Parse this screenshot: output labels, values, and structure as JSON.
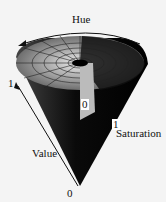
{
  "diagram": {
    "labels": {
      "hue": "Hue",
      "value": "Value",
      "saturation": "Saturation",
      "value_max": "1",
      "value_min": "0",
      "saturation_min": "0",
      "saturation_max": "1"
    },
    "colors": {
      "background": "#f4f4f4",
      "cone_dark": "#080808",
      "cone_grey": "#555555",
      "cone_light": "#cfcfcf"
    }
  }
}
